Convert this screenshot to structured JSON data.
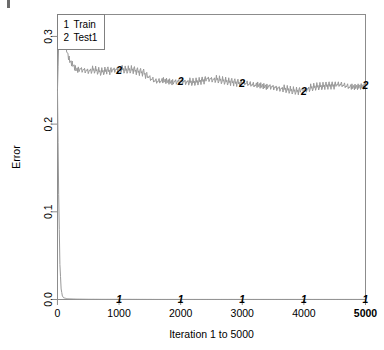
{
  "figure": {
    "background_color": "#ffffff",
    "corner_mark": "corner-mark-artifact"
  },
  "legend": {
    "border_color": "#808080",
    "entries": [
      {
        "key": "1",
        "label": "Train"
      },
      {
        "key": "2",
        "label": "Test1"
      }
    ]
  },
  "chart_data": {
    "type": "line",
    "title": "",
    "xlabel": "Iteration 1 to 5000",
    "ylabel": "Error",
    "xlim": [
      1,
      5000
    ],
    "ylim": [
      0.0,
      0.325
    ],
    "grid": false,
    "legend_position": "top-left",
    "xticks": [
      0,
      1000,
      2000,
      3000,
      4000,
      5000
    ],
    "xtick_labels": [
      "0",
      "1000",
      "2000",
      "3000",
      "4000",
      "5000"
    ],
    "xtick_bold_index": 5,
    "yticks": [
      0.0,
      0.1,
      0.2,
      0.3
    ],
    "ytick_labels": [
      "0.0",
      "0.1",
      "0.2",
      "0.3"
    ],
    "line_color": "#999999",
    "marker_color": "#1a1a1a",
    "series": [
      {
        "name": "Train",
        "key": "1",
        "marker_x": [
          1000,
          2000,
          3000,
          4000,
          5000
        ],
        "marker_y": [
          0.0,
          0.0,
          0.0,
          0.0,
          0.0
        ],
        "x": [
          1,
          20,
          40,
          60,
          80,
          100,
          150,
          200,
          300,
          500,
          800,
          1200,
          1600,
          2000,
          2500,
          3000,
          3500,
          4000,
          4500,
          5000
        ],
        "values": [
          0.238,
          0.12,
          0.04,
          0.012,
          0.004,
          0.002,
          0.001,
          0.0008,
          0.0005,
          0.0003,
          0.0002,
          0.0002,
          0.0001,
          0.0001,
          0.0001,
          0.0001,
          0.0001,
          0.0001,
          0.0001,
          0.0001
        ]
      },
      {
        "name": "Test1",
        "key": "2",
        "marker_x": [
          1000,
          2000,
          3000,
          4000,
          5000
        ],
        "marker_y": [
          0.262,
          0.249,
          0.247,
          0.238,
          0.244
        ],
        "x": [
          1,
          30,
          60,
          90,
          120,
          160,
          200,
          250,
          300,
          400,
          500,
          600,
          700,
          800,
          900,
          1000,
          1100,
          1200,
          1300,
          1400,
          1500,
          1600,
          1700,
          1800,
          1900,
          2000,
          2200,
          2400,
          2600,
          2800,
          3000,
          3200,
          3400,
          3600,
          3800,
          4000,
          4200,
          4400,
          4600,
          4800,
          5000
        ],
        "values": [
          0.24,
          0.318,
          0.3,
          0.308,
          0.292,
          0.281,
          0.272,
          0.268,
          0.263,
          0.262,
          0.261,
          0.262,
          0.26,
          0.262,
          0.261,
          0.262,
          0.261,
          0.262,
          0.26,
          0.259,
          0.252,
          0.249,
          0.25,
          0.249,
          0.248,
          0.249,
          0.248,
          0.251,
          0.25,
          0.248,
          0.247,
          0.245,
          0.243,
          0.241,
          0.239,
          0.238,
          0.242,
          0.244,
          0.245,
          0.242,
          0.244
        ]
      }
    ]
  }
}
